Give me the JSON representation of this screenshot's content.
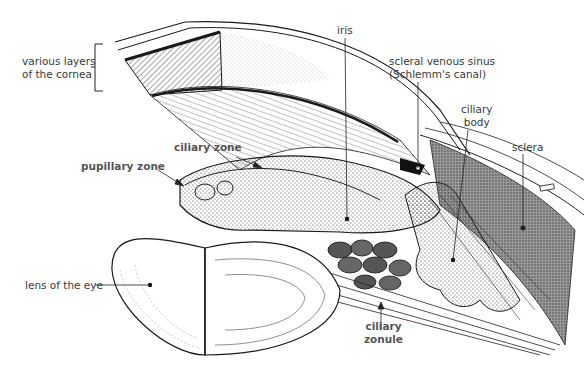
{
  "figure": {
    "labels": {
      "cornea_layers": "various layers of the cornea",
      "cornea_layers_line1": "various layers",
      "cornea_layers_line2": "of the cornea",
      "iris": "iris",
      "scleral_sinus_line1": "scleral venous sinus",
      "scleral_sinus_line2": "(Schlemm's canal)",
      "ciliary_body_line1": "ciliary",
      "ciliary_body_line2": "body",
      "sclera": "sclera",
      "ciliary_zone": "ciliary zone",
      "pupillary_zone": "pupillary zone",
      "lens": "lens of the eye",
      "ciliary_zonule_line1": "ciliary",
      "ciliary_zonule_line2": "zonule"
    },
    "colors": {
      "ink": "#1a1a1a",
      "label_text": "#3a3a3a",
      "bold_label_text": "#555555",
      "sclera_fill": "#8a8a8a",
      "background": "#ffffff"
    }
  }
}
